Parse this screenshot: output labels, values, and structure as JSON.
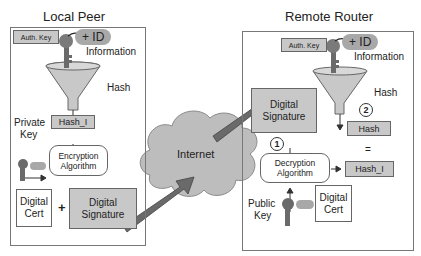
{
  "local_peer": {
    "title": "Local Peer",
    "auth_key": "Auth. Key",
    "id_badge": "+ ID",
    "information": "Information",
    "hash_label": "Hash",
    "hash_box": "Hash_I",
    "private_key_line1": "Private",
    "private_key_line2": "Key",
    "encryption_line1": "Encryption",
    "encryption_line2": "Algorithm",
    "digital_cert_line1": "Digital",
    "digital_cert_line2": "Cert",
    "plus": "+",
    "digital_signature_line1": "Digital",
    "digital_signature_line2": "Signature"
  },
  "internet": {
    "label": "Internet"
  },
  "remote_router": {
    "title": "Remote Router",
    "auth_key": "Auth. Key",
    "id_badge": "+ ID",
    "information": "Information",
    "hash_label": "Hash",
    "step_2": "2",
    "hash_box": "Hash",
    "equals": "=",
    "digital_signature_line1": "Digital",
    "digital_signature_line2": "Signature",
    "step_1": "1",
    "decryption_line1": "Decryption",
    "decryption_line2": "Algorithm",
    "hash_i_box": "Hash_I",
    "digital_cert_line1": "Digital",
    "digital_cert_line2": "Cert",
    "public_key_line1": "Public",
    "public_key_line2": "Key"
  },
  "colors": {
    "box_fill": "#c8c8c8",
    "cloud_fill": "#bdbdbd",
    "arrow_fill": "#6a6a6a"
  }
}
